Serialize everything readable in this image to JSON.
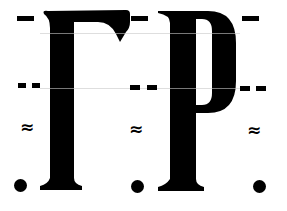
{
  "specimen": {
    "letters": [
      {
        "char": "Γ",
        "name": "Gamma"
      },
      {
        "char": "Ρ",
        "name": "Rho"
      }
    ],
    "marker_rows": [
      {
        "symbol": "–",
        "label": "single-dash"
      },
      {
        "symbol": "– –",
        "label": "double-dash"
      },
      {
        "symbol": "≈",
        "label": "approx"
      },
      {
        "symbol": "•",
        "label": "dot"
      }
    ],
    "colors": {
      "ink": "#000000",
      "paper": "#ffffff"
    }
  }
}
